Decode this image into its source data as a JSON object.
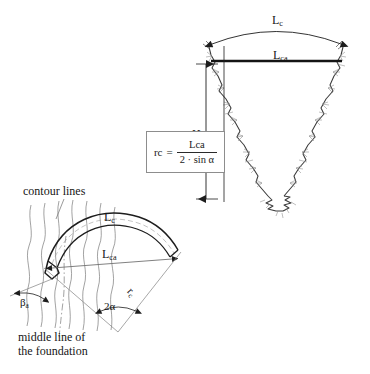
{
  "figure": {
    "background_color": "#ffffff",
    "ink_color": "#1a1a1a",
    "line_color": "#2a2a2a",
    "hairline_color": "#6b6b6b"
  },
  "top_diagram": {
    "name": "crack-wedge-section",
    "arc_label": "L",
    "arc_label_sub": "c",
    "chord_label": "L",
    "chord_label_sub": "ca",
    "height_label": "H"
  },
  "formula": {
    "lhs": "r",
    "lhs_sub": "c",
    "equals": "=",
    "numerator": "L",
    "numerator_sub": "ca",
    "denominator": "2 · sin α"
  },
  "bottom_diagram": {
    "name": "curved-foundation-plan",
    "arc_label": "L",
    "arc_label_sub": "c",
    "chord_label": "L",
    "chord_label_sub": "ca",
    "radius_label": "r",
    "radius_label_sub": "c",
    "angle_label": "2α",
    "beta_label": "β",
    "beta_label_sub": "a",
    "contour_label": "contour lines",
    "middle_line_label_1": "middle line of",
    "middle_line_label_2": "the foundation"
  }
}
